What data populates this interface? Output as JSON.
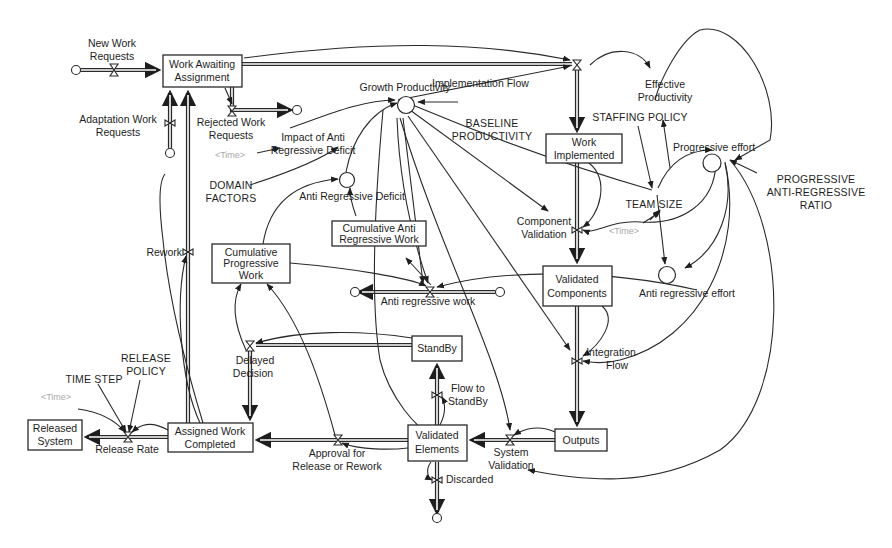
{
  "diagram": {
    "type": "stock-and-flow",
    "stocks": {
      "work_awaiting": [
        "Work Awaiting",
        "Assignment"
      ],
      "work_implemented": [
        "Work",
        "Implemented"
      ],
      "validated_components": [
        "Validated",
        "Components"
      ],
      "outputs": [
        "Outputs"
      ],
      "validated_elements": [
        "Validated",
        "Elements"
      ],
      "standby": [
        "StandBy"
      ],
      "assigned_work_completed": [
        "Assigned Work",
        "Completed"
      ],
      "released_system": [
        "Released",
        "System"
      ],
      "cumulative_progressive_work": [
        "Cumulative",
        "Progressive",
        "Work"
      ],
      "cumulative_anti_regressive_work": [
        "Cumulative Anti",
        "Regressive Work"
      ]
    },
    "flows": {
      "new_work_requests": [
        "New Work",
        "Requests"
      ],
      "adaptation_work_requests": [
        "Adaptation Work",
        "Requests"
      ],
      "rejected_work_requests": [
        "Rejected Work",
        "Requests"
      ],
      "implementation_flow": [
        "Implementation Flow"
      ],
      "component_validation": [
        "Component",
        "Validation"
      ],
      "integration_flow": [
        "Integration",
        "Flow"
      ],
      "system_validation": [
        "System",
        "Validation"
      ],
      "flow_to_standby": [
        "Flow to",
        "StandBy"
      ],
      "discarded": [
        "Discarded"
      ],
      "approval": [
        "Approval for",
        "Release or Rework"
      ],
      "delayed_decision": [
        "Delayed",
        "Decision"
      ],
      "rework": [
        "Rework"
      ],
      "release_rate": [
        "Release Rate"
      ],
      "anti_regressive_work": [
        "Anti regressive work"
      ]
    },
    "auxiliaries": {
      "growth_productivity": [
        "Growth Productivity"
      ],
      "impact_of_anti_regressive_deficit": [
        "Impact of Anti",
        "Regressive Deficit"
      ],
      "anti_regressive_deficit": [
        "Anti Regressive Deficit"
      ],
      "effective_productivity": [
        "Effective",
        "Productivity"
      ],
      "progressive_effort": [
        "Progressive effort"
      ],
      "anti_regressive_effort": [
        "Anti regressive effort"
      ],
      "team_size": [
        "TEAM SIZE"
      ]
    },
    "constants": {
      "baseline_productivity": [
        "BASELINE",
        "PRODUCTIVITY"
      ],
      "staffing_policy": [
        "STAFFING POLICY"
      ],
      "domain_factors": [
        "DOMAIN",
        "FACTORS"
      ],
      "progressive_anti_regressive_ratio": [
        "PROGRESSIVE",
        "ANTI-REGRESSIVE",
        "RATIO"
      ],
      "release_policy": [
        "RELEASE",
        "POLICY"
      ],
      "time_step": [
        "TIME STEP"
      ]
    },
    "shadow_variables": {
      "time_1": "<Time>",
      "time_2": "<Time>",
      "time_3": "<Time>"
    }
  }
}
